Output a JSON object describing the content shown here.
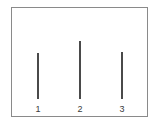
{
  "figure": {
    "background_color": "#ffffff",
    "frame": {
      "border_color": "#8a8a8a",
      "fill_color": "#ffffff"
    },
    "line_color": "#4a4a4a"
  },
  "chart_data": {
    "type": "bar",
    "title": "",
    "subtitle": "",
    "xlabel": "",
    "ylabel": "",
    "categories": [
      "1",
      "2",
      "3"
    ],
    "values": [
      62,
      78,
      64
    ],
    "ylim": [
      0,
      100
    ],
    "grid": false,
    "legend": null,
    "tick_labels": {
      "x": [
        "1",
        "2",
        "3"
      ],
      "y": []
    },
    "annotations": []
  }
}
